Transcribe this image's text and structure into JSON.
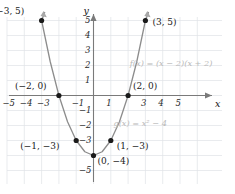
{
  "chart_data": {
    "type": "line",
    "title": "",
    "xlabel": "x",
    "ylabel": "y",
    "xlim": [
      -6,
      6
    ],
    "ylim": [
      -6,
      6
    ],
    "grid": true,
    "legend": "none",
    "function": "y = x^2 - 4",
    "curve_color": "#8c8c8c",
    "point_color": "#1a1a1a",
    "grid_color": "#dfe3e6",
    "axis_color": "#7a7a7a",
    "annotation_color": "#b9b9b9",
    "x": [
      -3,
      -2.5,
      -2,
      -1.5,
      -1,
      -0.5,
      0,
      0.5,
      1,
      1.5,
      2,
      2.5,
      3
    ],
    "values": [
      5,
      2.25,
      0,
      -1.75,
      -3,
      -3.75,
      -4,
      -3.75,
      -3,
      -1.75,
      0,
      2.25,
      5
    ],
    "points": [
      {
        "id": "p-neg3-5",
        "x": -3,
        "y": 5,
        "label": "(−3, 5)",
        "label_pos": "left"
      },
      {
        "id": "p-3-5",
        "x": 3,
        "y": 5,
        "label": "(3, 5)",
        "label_pos": "right"
      },
      {
        "id": "p-neg2-0",
        "x": -2,
        "y": 0,
        "label": "(−2, 0)",
        "label_pos": "left"
      },
      {
        "id": "p-2-0",
        "x": 2,
        "y": 0,
        "label": "(2, 0)",
        "label_pos": "right"
      },
      {
        "id": "p-neg1-neg3",
        "x": -1,
        "y": -3,
        "label": "(−1, −3)",
        "label_pos": "left"
      },
      {
        "id": "p-1-neg3",
        "x": 1,
        "y": -3,
        "label": "(1, −3)",
        "label_pos": "right"
      },
      {
        "id": "p-0-neg4",
        "x": 0,
        "y": -4,
        "label": "(0, −4)",
        "label_pos": "right"
      }
    ],
    "xticks": [
      {
        "value": -5,
        "label": "−5"
      },
      {
        "value": -4,
        "label": "−4"
      },
      {
        "value": -3,
        "label": "−3"
      },
      {
        "value": -1,
        "label": "−1"
      },
      {
        "value": 1,
        "label": "1"
      },
      {
        "value": 3,
        "label": "3"
      },
      {
        "value": 4,
        "label": "4"
      },
      {
        "value": 5,
        "label": "5"
      }
    ],
    "yticks": [
      {
        "value": 5,
        "label": "5"
      },
      {
        "value": 4,
        "label": "4"
      },
      {
        "value": 3,
        "label": "3"
      },
      {
        "value": 2,
        "label": "2"
      },
      {
        "value": 1,
        "label": "1"
      },
      {
        "value": -1,
        "label": "−1"
      },
      {
        "value": -2,
        "label": "−2"
      },
      {
        "value": -3,
        "label": "−3"
      },
      {
        "value": -5,
        "label": "−5"
      }
    ],
    "annotations": [
      {
        "id": "fn-f",
        "text": "f(x) = (x − 2)(x + 2)",
        "x": 2.1,
        "y": 2.2
      },
      {
        "id": "fn-g",
        "text": "g(x) = x² − 4",
        "x": 1.15,
        "y": -1.85
      }
    ]
  },
  "axes": {
    "x_label": "x",
    "y_label": "y"
  }
}
